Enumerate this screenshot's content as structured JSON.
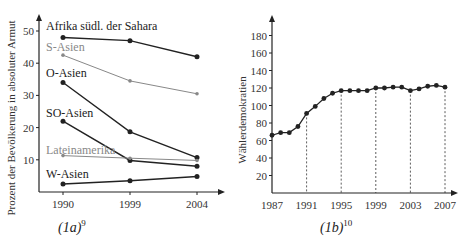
{
  "chart_data": [
    {
      "type": "line",
      "caption": "(1a)",
      "caption_sup": "9",
      "title": "",
      "xlabel": "",
      "ylabel": "Prozent der Bevölkerung in absoluter Armut",
      "x": [
        1990,
        1999,
        2004
      ],
      "x_ticks": [
        "1990",
        "1999",
        "2004"
      ],
      "y_ticks": [
        10,
        20,
        30,
        40,
        50
      ],
      "ylim": [
        0,
        55
      ],
      "grid": false,
      "legend": "inline labels",
      "series": [
        {
          "name": "Afrika südl. der Sahara",
          "values": [
            48,
            47,
            42
          ],
          "color": "#222222"
        },
        {
          "name": "S-Asien",
          "values": [
            42.5,
            34.5,
            30.5
          ],
          "color": "#888888"
        },
        {
          "name": "O-Asien",
          "values": [
            34,
            18.7,
            10.7
          ],
          "color": "#222222"
        },
        {
          "name": "SO-Asien",
          "values": [
            22,
            9.8,
            8
          ],
          "color": "#222222"
        },
        {
          "name": "Lateinamerika",
          "values": [
            11.3,
            10.5,
            9.8
          ],
          "color": "#888888"
        },
        {
          "name": "W-Asien",
          "values": [
            2.5,
            3.5,
            4.8
          ],
          "color": "#222222"
        }
      ]
    },
    {
      "type": "line",
      "caption": "(1b)",
      "caption_sup": "10",
      "title": "",
      "xlabel": "",
      "ylabel": "Wählerdemokratien",
      "x": [
        1987,
        1988,
        1989,
        1990,
        1991,
        1992,
        1993,
        1994,
        1995,
        1996,
        1997,
        1998,
        1999,
        2000,
        2001,
        2002,
        2003,
        2004,
        2005,
        2006,
        2007
      ],
      "x_ticks": [
        "1987",
        "1991",
        "1995",
        "1999",
        "2003",
        "2007"
      ],
      "y_ticks": [
        20,
        40,
        60,
        80,
        100,
        120,
        140,
        160,
        180
      ],
      "ylim": [
        0,
        200
      ],
      "grid": "dashed vertical lines at 1991, 1995, 1999, 2003, 2007",
      "series": [
        {
          "name": "Wählerdemokratien",
          "values": [
            66,
            69,
            69,
            76,
            91,
            99,
            108,
            114,
            117,
            117,
            117,
            117,
            120,
            120,
            121,
            121,
            117,
            119,
            122,
            123,
            121
          ],
          "color": "#222222"
        }
      ]
    }
  ]
}
